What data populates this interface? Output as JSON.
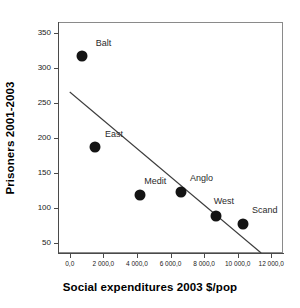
{
  "chart_data": {
    "type": "scatter",
    "title": "",
    "xlabel": "Social expenditures 2003 $/pop",
    "ylabel": "Prisoners 2001-2003",
    "xlim": [
      -700,
      12700
    ],
    "ylim": [
      35,
      365
    ],
    "grid": false,
    "legend": null,
    "xticks": [
      0,
      2000,
      4000,
      6000,
      8000,
      10000,
      12000
    ],
    "xtick_labels": [
      "0,0",
      "2 000,0",
      "4 000,0",
      "6 000,0",
      "8 000,0",
      "10 000,0",
      "12 000,0"
    ],
    "yticks": [
      50,
      100,
      150,
      200,
      250,
      300,
      350
    ],
    "ytick_labels": [
      "50",
      "100",
      "150",
      "200",
      "250",
      "300",
      "350"
    ],
    "points": [
      {
        "label": "Balt",
        "x": 700,
        "y": 316,
        "label_dx": 22,
        "label_dy": -13
      },
      {
        "label": "East",
        "x": 1500,
        "y": 186,
        "label_dx": 19,
        "label_dy": -13
      },
      {
        "label": "Medit",
        "x": 4200,
        "y": 118,
        "label_dx": 15,
        "label_dy": -14
      },
      {
        "label": "Anglo",
        "x": 6600,
        "y": 122,
        "label_dx": 21,
        "label_dy": -14
      },
      {
        "label": "West",
        "x": 8700,
        "y": 88,
        "label_dx": 8,
        "label_dy": -15
      },
      {
        "label": "Scand",
        "x": 10300,
        "y": 76,
        "label_dx": 22,
        "label_dy": -14
      }
    ],
    "trendline": {
      "x_start": 0,
      "y_start": 265,
      "x_end": 11400,
      "y_end": 35,
      "color": "#3d3d3d"
    },
    "marker_color": "#141414",
    "axis_color": "#4a4a4a",
    "frame_color": "#8a8a8a"
  }
}
